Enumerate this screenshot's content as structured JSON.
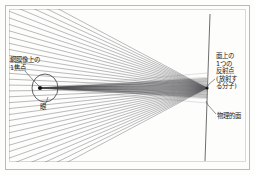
{
  "figure": {
    "name": "optics-ray-diagram",
    "frame": {
      "border_color": "#b9b9b9",
      "background_color": "#fdfdfc"
    },
    "colors": {
      "ray": "#6e6e72",
      "ray_bundle": "#2b2b2e",
      "eye_outline": "#3a3a3d",
      "focal_point": "#111114",
      "surface_line": "#4a4a4d",
      "leader_line": "#4a4a4d",
      "text": "#1a1a1a"
    },
    "labels": {
      "focal_point": "網膜像上の\n1焦点",
      "eye": "眼",
      "reflection_point": "面上の\n1つの\n反射点\n(放射す\nる分子)",
      "physical_surface": "物理的面"
    },
    "geometry": {
      "eye_center_x": 45,
      "eye_center_y": 88,
      "eye_radius_x": 13,
      "eye_radius_y": 14,
      "focal_point_x": 40,
      "focal_point_y": 88,
      "source_x": 207,
      "source_y": 88,
      "surface_top_x": 210,
      "surface_top_y": 14,
      "surface_bottom_x": 205,
      "surface_bottom_y": 161,
      "fan_ray_count": 34,
      "fan_angle_start_deg": 152,
      "fan_angle_end_deg": 208,
      "bundle_ray_count": 17
    }
  }
}
